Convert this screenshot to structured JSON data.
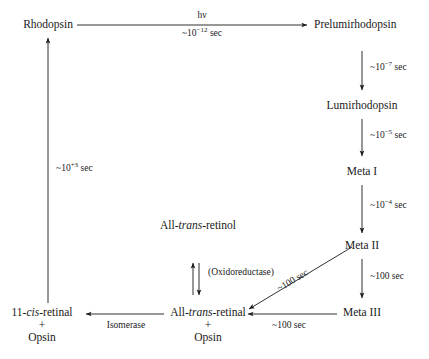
{
  "diagram": {
    "background_color": "#ffffff",
    "ink_color": "#1a1a1a",
    "nodes": [
      {
        "id": "rhodopsin",
        "label": "Rhodopsin"
      },
      {
        "id": "prelumirhodopsin",
        "label": "Prelumirhodopsin"
      },
      {
        "id": "lumirhodopsin",
        "label": "Lumirhodopsin"
      },
      {
        "id": "meta_i",
        "label": "Meta I"
      },
      {
        "id": "meta_ii",
        "label": "Meta II"
      },
      {
        "id": "meta_iii",
        "label": "Meta III"
      },
      {
        "id": "all_trans_retinol",
        "label_pre": "All-",
        "label_it": "trans",
        "label_post": "-retinol"
      },
      {
        "id": "all_trans_retinal",
        "label_pre": "All-",
        "label_it": "trans",
        "label_post": "-retinal",
        "plus": "+",
        "partner": "Opsin"
      },
      {
        "id": "eleven_cis_retinal",
        "label_pre": "11-",
        "label_it": "cis",
        "label_post": "-retinal",
        "plus": "+",
        "partner": "Opsin"
      }
    ],
    "edges": [
      {
        "id": "rho_to_prelumi",
        "above": "hν",
        "below_pre": "~10",
        "below_exp": "−12",
        "below_post": " sec"
      },
      {
        "id": "prelumi_to_lumi",
        "label_pre": "~10",
        "label_exp": "−7",
        "label_post": " sec"
      },
      {
        "id": "lumi_to_metai",
        "label_pre": "~10",
        "label_exp": "−5",
        "label_post": " sec"
      },
      {
        "id": "metai_to_metaii",
        "label_pre": "~10",
        "label_exp": "−4",
        "label_post": " sec"
      },
      {
        "id": "metaii_to_metaiii",
        "label": "~100 sec"
      },
      {
        "id": "metaiii_to_atr",
        "label": "~100 sec"
      },
      {
        "id": "metaii_to_atr",
        "label": "~100 sec"
      },
      {
        "id": "atr_to_11cis",
        "label": "Isomerase"
      },
      {
        "id": "retinol_redox",
        "label": "(Oxidoreductase)"
      },
      {
        "id": "11cis_to_rho",
        "label_pre": "~10",
        "label_exp": "+3",
        "label_post": " sec"
      }
    ]
  }
}
